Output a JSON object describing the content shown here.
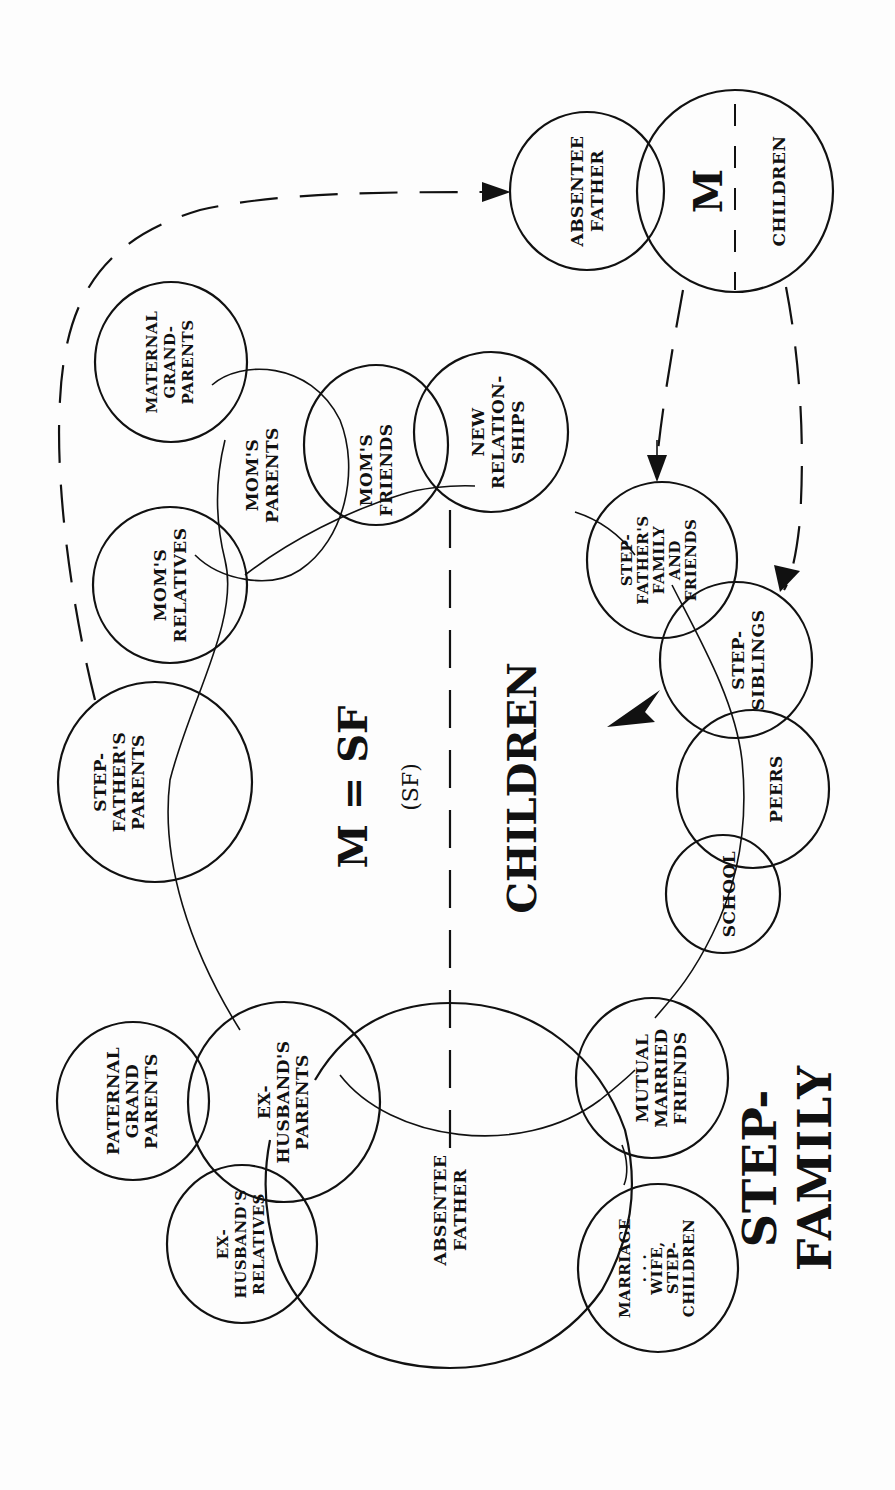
{
  "diagram": {
    "title": {
      "line1": "STEP-",
      "line2": "FAMILY"
    },
    "center": {
      "couple": "M = SF",
      "sub": "(SF)",
      "children": "CHILDREN"
    },
    "original_family": {
      "absentee_father": [
        "ABSENTEE",
        "FATHER"
      ],
      "mother": "M",
      "children": "CHILDREN"
    },
    "circles": {
      "maternal_grandparents": [
        "MATERNAL",
        "GRAND-",
        "PARENTS"
      ],
      "moms_parents": [
        "MOM'S",
        "PARENTS"
      ],
      "moms_friends": [
        "MOM'S",
        "FRIENDS"
      ],
      "new_relationships": [
        "NEW",
        "RELATION-",
        "SHIPS"
      ],
      "moms_relatives": [
        "MOM'S",
        "RELATIVES"
      ],
      "stepfathers_parents": [
        "STEP-",
        "FATHER'S",
        "PARENTS"
      ],
      "stepfathers_family": [
        "STEP-",
        "FATHER'S",
        "FAMILY",
        "AND",
        "FRIENDS"
      ],
      "step_siblings": [
        "STEP-",
        "SIBLINGS"
      ],
      "peers": [
        "PEERS"
      ],
      "school": [
        "SCHOOL"
      ],
      "paternal_grandparents": [
        "PATERNAL",
        "GRAND",
        "PARENTS"
      ],
      "ex_husbands_parents": [
        "EX-",
        "HUSBAND'S",
        "PARENTS"
      ],
      "ex_husbands_relatives": [
        "EX-",
        "HUSBAND'S",
        "RELATIVES"
      ],
      "absentee_father_big": [
        "ABSENTEE",
        "FATHER"
      ],
      "mutual_married_friends": [
        "MUTUAL",
        "MARRIED",
        "FRIENDS"
      ],
      "marriage": [
        "MARRIAGE",
        ". . .",
        "WIFE,",
        "STEP-",
        "CHILDREN"
      ]
    },
    "colors": {
      "ink": "#111111",
      "paper": "#fdfdfd"
    }
  }
}
